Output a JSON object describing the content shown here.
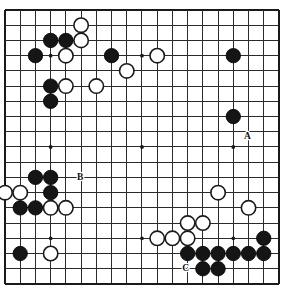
{
  "figure": {
    "kind": "go-board-diagram",
    "board_size": 19,
    "colors": {
      "background": "#ffffff",
      "line": "#2b2b2b",
      "border": "#1a1a1a",
      "black_stone": "#151515",
      "white_stone": "#ffffff",
      "label_text": "#111111"
    }
  },
  "geometry": {
    "origin_x": 5,
    "origin_y": 10,
    "spacing": 15.22,
    "stone_radius": 7.2,
    "star_radius": 1.9
  },
  "chart_data": {
    "type": "table",
    "xlabel": "column (1-19, left to right)",
    "ylabel": "row (1-19, top to bottom)",
    "columns": [
      "color",
      "col",
      "row"
    ],
    "star_points": [
      [
        4,
        4
      ],
      [
        10,
        4
      ],
      [
        16,
        4
      ],
      [
        4,
        10
      ],
      [
        10,
        10
      ],
      [
        16,
        10
      ],
      [
        4,
        16
      ],
      [
        10,
        16
      ],
      [
        16,
        16
      ]
    ],
    "black_stones": [
      [
        4,
        3
      ],
      [
        5,
        3
      ],
      [
        3,
        4
      ],
      [
        8,
        4
      ],
      [
        16,
        4
      ],
      [
        4,
        6
      ],
      [
        4,
        7
      ],
      [
        16,
        8
      ],
      [
        3,
        12
      ],
      [
        4,
        12
      ],
      [
        4,
        13
      ],
      [
        2,
        14
      ],
      [
        3,
        14
      ],
      [
        2,
        17
      ],
      [
        18,
        16
      ],
      [
        13,
        17
      ],
      [
        14,
        17
      ],
      [
        15,
        17
      ],
      [
        16,
        17
      ],
      [
        17,
        17
      ],
      [
        18,
        17
      ],
      [
        14,
        18
      ],
      [
        15,
        18
      ]
    ],
    "white_stones": [
      [
        6,
        2
      ],
      [
        6,
        3
      ],
      [
        5,
        4
      ],
      [
        11,
        4
      ],
      [
        9,
        5
      ],
      [
        5,
        6
      ],
      [
        7,
        6
      ],
      [
        1,
        13
      ],
      [
        2,
        13
      ],
      [
        4,
        14
      ],
      [
        5,
        14
      ],
      [
        4,
        17
      ],
      [
        15,
        13
      ],
      [
        17,
        14
      ],
      [
        13,
        15
      ],
      [
        14,
        15
      ],
      [
        11,
        16
      ],
      [
        12,
        16
      ],
      [
        13,
        16
      ]
    ],
    "markers": [
      {
        "label": "A",
        "col": 17,
        "row": 9,
        "offset_x": -1,
        "offset_y": 5
      },
      {
        "label": "B",
        "col": 6,
        "row": 12,
        "offset_x": -1,
        "offset_y": 0
      },
      {
        "label": "C",
        "col": 13,
        "row": 18,
        "offset_x": -2,
        "offset_y": 0
      }
    ]
  },
  "annotations": {
    "marker_a": "A",
    "marker_b": "B",
    "marker_c": "C"
  }
}
